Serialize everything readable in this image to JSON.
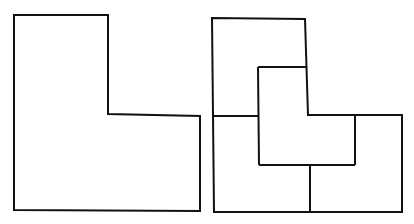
{
  "diagram": {
    "title": "",
    "figures": [
      {
        "name": "L-shape",
        "description": "Single L-shaped outline",
        "outline": [
          [
            14,
            15
          ],
          [
            108,
            15
          ],
          [
            108,
            114
          ],
          [
            200,
            116
          ],
          [
            200,
            211
          ],
          [
            14,
            210
          ]
        ]
      },
      {
        "name": "L-shape divided into four L-shaped pieces",
        "description": "Same L-shape partitioned into four congruent smaller L-shapes",
        "outline": [
          [
            212,
            18
          ],
          [
            305,
            19
          ],
          [
            308,
            115
          ],
          [
            402,
            115
          ],
          [
            402,
            212
          ],
          [
            214,
            212
          ]
        ],
        "inner_lines": [
          [
            [
              213,
              116
            ],
            [
              258,
              116
            ]
          ],
          [
            [
              258,
              67
            ],
            [
              306,
              67
            ]
          ],
          [
            [
              258,
              67
            ],
            [
              259,
              165
            ]
          ],
          [
            [
              259,
              165
            ],
            [
              355,
              165
            ]
          ],
          [
            [
              355,
              115
            ],
            [
              355,
              165
            ]
          ],
          [
            [
              310,
              165
            ],
            [
              310,
              212
            ]
          ]
        ]
      }
    ],
    "stroke_color": "#111111",
    "background_color": "#ffffff"
  }
}
